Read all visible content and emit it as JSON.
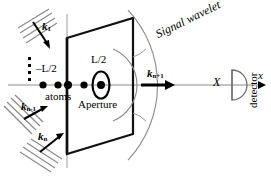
{
  "figure": {
    "colors": {
      "stroke_dark": "#111111",
      "stroke_gray": "#8a8a8a",
      "wavefront_gray": "#777777",
      "background": "#ffffff"
    }
  },
  "labels": {
    "k_first": {
      "base": "k",
      "sub": "1",
      "text": "k1"
    },
    "k_n_minus_1": {
      "base": "k",
      "sub": "n-1",
      "text": "kn-1"
    },
    "k_n": {
      "base": "k",
      "sub": "n",
      "text": "kn"
    },
    "k_n_plus_1": {
      "base": "k",
      "sub": "n+1",
      "text": "kn+1"
    },
    "minus_half_L": "–L/2",
    "plus_half_L": "L/2",
    "atoms": "atoms",
    "aperture": "Aperture",
    "signal_wavelet": "Signal wavelet",
    "big_X": "X",
    "detector": "detector",
    "x_axis": "x",
    "ellipsis_dots": "⋮"
  },
  "geometry": {
    "axis_y": 85,
    "aperture_x": 101,
    "aperture_y": 85,
    "screen_plane_x": 67,
    "detector_x": 232,
    "atom_positions_x": [
      43,
      58,
      68,
      84,
      101
    ],
    "vertical_dots_count": 4,
    "incoming_beams": 3,
    "wavefront_arcs": 2
  }
}
